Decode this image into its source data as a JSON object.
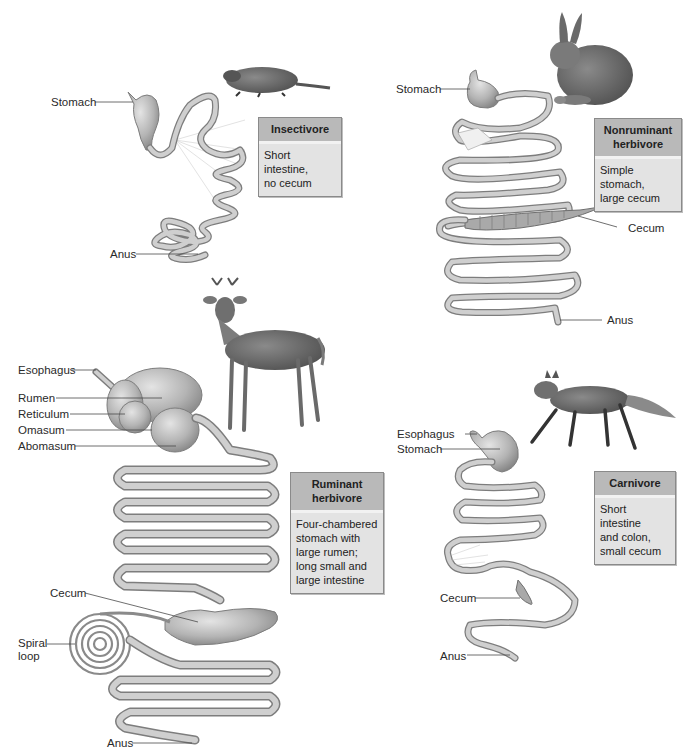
{
  "panels": {
    "insectivore": {
      "title": "Insectivore",
      "description": "Short intestine, no cecum",
      "desc_lines": [
        "Short intestine,",
        "no cecum"
      ],
      "animal": "mole",
      "labels": {
        "stomach": "Stomach",
        "anus": "Anus"
      }
    },
    "nonruminant": {
      "title": "Nonruminant herbivore",
      "title_lines": [
        "Nonruminant",
        "herbivore"
      ],
      "description": "Simple stomach, large cecum",
      "desc_lines": [
        "Simple stomach,",
        "large cecum"
      ],
      "animal": "rabbit",
      "labels": {
        "stomach": "Stomach",
        "cecum": "Cecum",
        "anus": "Anus"
      }
    },
    "ruminant": {
      "title": "Ruminant herbivore",
      "title_lines": [
        "Ruminant",
        "herbivore"
      ],
      "description": "Four-chambered stomach with large rumen; long small and large intestine",
      "desc_lines": [
        "Four-chambered",
        "stomach with",
        "large rumen;",
        "long small and",
        "large intestine"
      ],
      "animal": "deer",
      "labels": {
        "esophagus": "Esophagus",
        "rumen": "Rumen",
        "reticulum": "Reticulum",
        "omasum": "Omasum",
        "abomasum": "Abomasum",
        "cecum": "Cecum",
        "spiral_loop_1": "Spiral",
        "spiral_loop_2": "loop",
        "anus": "Anus"
      }
    },
    "carnivore": {
      "title": "Carnivore",
      "description": "Short intestine and colon, small cecum",
      "desc_lines": [
        "Short intestine",
        "and colon,",
        "small cecum"
      ],
      "animal": "fox",
      "labels": {
        "esophagus": "Esophagus",
        "stomach": "Stomach",
        "cecum": "Cecum",
        "anus": "Anus"
      }
    }
  },
  "colors": {
    "gut_fill": "#c9c9c9",
    "gut_stroke": "#7d7d7d",
    "box_head": "#b9b9b9",
    "box_body": "#e3e3e3",
    "leader": "#4a4a4a"
  }
}
